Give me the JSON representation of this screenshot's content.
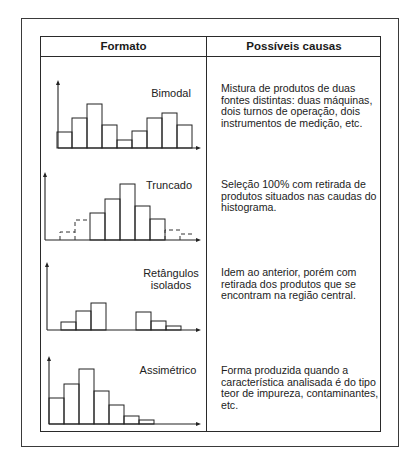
{
  "header": {
    "col_format": "Formato",
    "col_causes": "Possíveis causas"
  },
  "rows": [
    {
      "shape": "Bimodal",
      "shape_line2": "",
      "cause": "Mistura de produtos de duas fontes distintas: duas máquinas, dois turnos de operação, dois instrumentos de medição, etc."
    },
    {
      "shape": "Truncado",
      "shape_line2": "",
      "cause": "Seleção 100% com retirada de produtos situados nas caudas do histograma."
    },
    {
      "shape": "Retângulos",
      "shape_line2": "isolados",
      "cause": "Idem ao anterior, porém com retirada dos produtos que se encontram na região central."
    },
    {
      "shape": "Assimétrico",
      "shape_line2": "",
      "cause": "Forma produzida quando a característica analisada é do tipo teor de impureza, contaminantes, etc."
    }
  ],
  "chart_data": [
    {
      "type": "bar",
      "title": "Bimodal",
      "categories": [
        "1",
        "2",
        "3",
        "4",
        "5",
        "6",
        "7",
        "8",
        "9"
      ],
      "values": [
        16,
        30,
        44,
        23,
        8,
        17,
        30,
        35,
        23
      ],
      "dashed": [
        false,
        false,
        false,
        false,
        false,
        false,
        false,
        false,
        false
      ],
      "xlabel": "",
      "ylabel": "",
      "grid": false
    },
    {
      "type": "bar",
      "title": "Truncado",
      "categories": [
        "1",
        "2",
        "3",
        "4",
        "5",
        "6",
        "7",
        "8",
        "9"
      ],
      "values": [
        8,
        20,
        27,
        41,
        56,
        34,
        21,
        10,
        6
      ],
      "dashed": [
        true,
        true,
        false,
        false,
        false,
        false,
        false,
        true,
        true
      ],
      "xlabel": "",
      "ylabel": "",
      "grid": false
    },
    {
      "type": "bar",
      "title": "Retângulos isolados",
      "categories": [
        "1",
        "2",
        "3",
        "4",
        "5",
        "6",
        "7",
        "8",
        "9"
      ],
      "values": [
        8,
        19,
        27,
        0,
        0,
        18,
        9,
        4
      ],
      "dashed": [
        false,
        false,
        false,
        false,
        false,
        false,
        false,
        false
      ],
      "xlabel": "",
      "ylabel": "",
      "grid": false
    },
    {
      "type": "bar",
      "title": "Assimétrico",
      "categories": [
        "1",
        "2",
        "3",
        "4",
        "5",
        "6",
        "7"
      ],
      "values": [
        26,
        40,
        55,
        33,
        19,
        8,
        4
      ],
      "dashed": [
        false,
        false,
        false,
        false,
        false,
        false,
        false
      ],
      "xlabel": "",
      "ylabel": "",
      "grid": false
    }
  ]
}
